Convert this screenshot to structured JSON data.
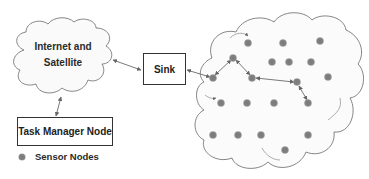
{
  "diagram": {
    "internet_cloud": {
      "line1": "Internet and",
      "line2": "Satellite"
    },
    "sink": {
      "label": "Sink"
    },
    "task_manager": {
      "label": "Task Manager Node"
    },
    "legend": {
      "label": "Sensor Nodes",
      "dot_color": "#7a7a7a"
    },
    "colors": {
      "node": "#7a7a7a",
      "stroke": "#777777",
      "box_border": "#333333"
    },
    "sensor_nodes": [
      {
        "x": 248,
        "y": 43
      },
      {
        "x": 283,
        "y": 43
      },
      {
        "x": 320,
        "y": 41
      },
      {
        "x": 233,
        "y": 58
      },
      {
        "x": 272,
        "y": 62
      },
      {
        "x": 289,
        "y": 62
      },
      {
        "x": 311,
        "y": 62
      },
      {
        "x": 213,
        "y": 78
      },
      {
        "x": 252,
        "y": 78
      },
      {
        "x": 297,
        "y": 82
      },
      {
        "x": 328,
        "y": 77
      },
      {
        "x": 221,
        "y": 103
      },
      {
        "x": 247,
        "y": 103
      },
      {
        "x": 274,
        "y": 103
      },
      {
        "x": 308,
        "y": 103
      },
      {
        "x": 213,
        "y": 135
      },
      {
        "x": 238,
        "y": 135
      },
      {
        "x": 261,
        "y": 135
      },
      {
        "x": 308,
        "y": 135
      },
      {
        "x": 285,
        "y": 150
      }
    ],
    "links": [
      {
        "from": [
          113,
          60
        ],
        "to": [
          141,
          70
        ],
        "bidirectional": true
      },
      {
        "from": [
          61,
          97
        ],
        "to": [
          56,
          116
        ],
        "bidirectional": true
      },
      {
        "from": [
          187,
          70
        ],
        "to": [
          210,
          77
        ],
        "bidirectional": true
      },
      {
        "from": [
          215,
          75
        ],
        "to": [
          231,
          60
        ],
        "bidirectional": true
      },
      {
        "from": [
          236,
          60
        ],
        "to": [
          250,
          75
        ],
        "bidirectional": true
      },
      {
        "from": [
          256,
          78
        ],
        "to": [
          294,
          82
        ],
        "bidirectional": true
      },
      {
        "from": [
          299,
          86
        ],
        "to": [
          307,
          100
        ],
        "bidirectional": true
      }
    ]
  }
}
